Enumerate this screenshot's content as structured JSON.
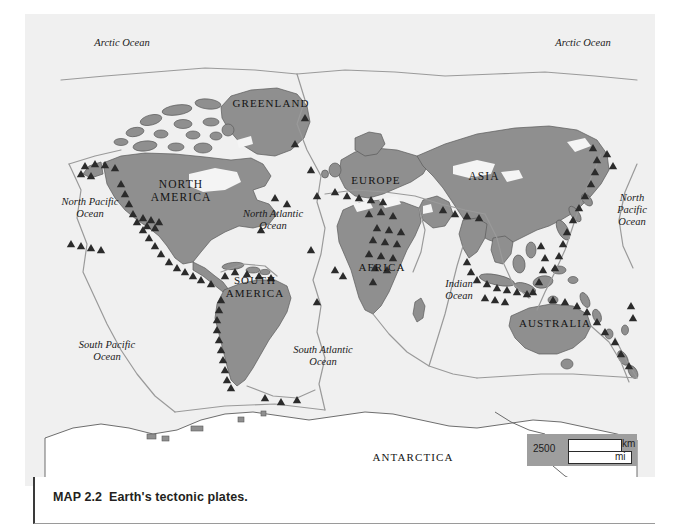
{
  "figure": {
    "caption_number": "MAP 2.2",
    "caption_title": "Earth's tectonic plates."
  },
  "map": {
    "ocean_color": "#f0f0f0",
    "land_color": "#8f8f8f",
    "ice_color": "#f4f4f4",
    "boundary_color": "#8a8a8a",
    "marker_color": "#2b2b2b",
    "coast_color": "#4a4a4a",
    "ocean_labels": [
      {
        "key": "arctic_west",
        "text": "Arctic Ocean",
        "x": 77,
        "y": 43,
        "w": 90
      },
      {
        "key": "arctic_east",
        "text": "Arctic Ocean",
        "x": 538,
        "y": 43,
        "w": 90
      },
      {
        "key": "north_pacific_west",
        "text": "North Pacific\nOcean",
        "x": 44,
        "y": 196,
        "w": 92
      },
      {
        "key": "north_atlantic",
        "text": "North Atlantic\nOcean",
        "x": 224,
        "y": 208,
        "w": 98
      },
      {
        "key": "north_pacific_east",
        "text": "North\nPacific\nOcean",
        "x": 603,
        "y": 192,
        "w": 58
      },
      {
        "key": "indian",
        "text": "Indian\nOcean",
        "x": 428,
        "y": 278,
        "w": 62
      },
      {
        "key": "south_pacific",
        "text": "South Pacific\nOcean",
        "x": 60,
        "y": 339,
        "w": 94
      },
      {
        "key": "south_atlantic",
        "text": "South Atlantic\nOcean",
        "x": 274,
        "y": 344,
        "w": 98
      }
    ],
    "continent_labels": [
      {
        "key": "greenland",
        "text": "GREENLAND",
        "x": 228,
        "y": 97,
        "w": 86,
        "size": "normal"
      },
      {
        "key": "north_america",
        "text": "NORTH\nAMERICA",
        "x": 148,
        "y": 178,
        "w": 66,
        "size": "big"
      },
      {
        "key": "europe",
        "text": "EUROPE",
        "x": 348,
        "y": 174,
        "w": 56,
        "size": "normal"
      },
      {
        "key": "asia",
        "text": "ASIA",
        "x": 464,
        "y": 170,
        "w": 40,
        "size": "big"
      },
      {
        "key": "africa",
        "text": "AFRICA",
        "x": 356,
        "y": 261,
        "w": 52,
        "size": "normal"
      },
      {
        "key": "south_america",
        "text": "SOUTH\nAMERICA",
        "x": 222,
        "y": 274,
        "w": 66,
        "size": "normal"
      },
      {
        "key": "australia",
        "text": "AUSTRALIA",
        "x": 518,
        "y": 317,
        "w": 74,
        "size": "normal"
      },
      {
        "key": "antarctica",
        "text": "ANTARCTICA",
        "x": 370,
        "y": 451,
        "w": 86,
        "size": "normal"
      }
    ]
  },
  "scale": {
    "value": "2500",
    "unit_top": "km",
    "unit_bottom": "mi"
  }
}
